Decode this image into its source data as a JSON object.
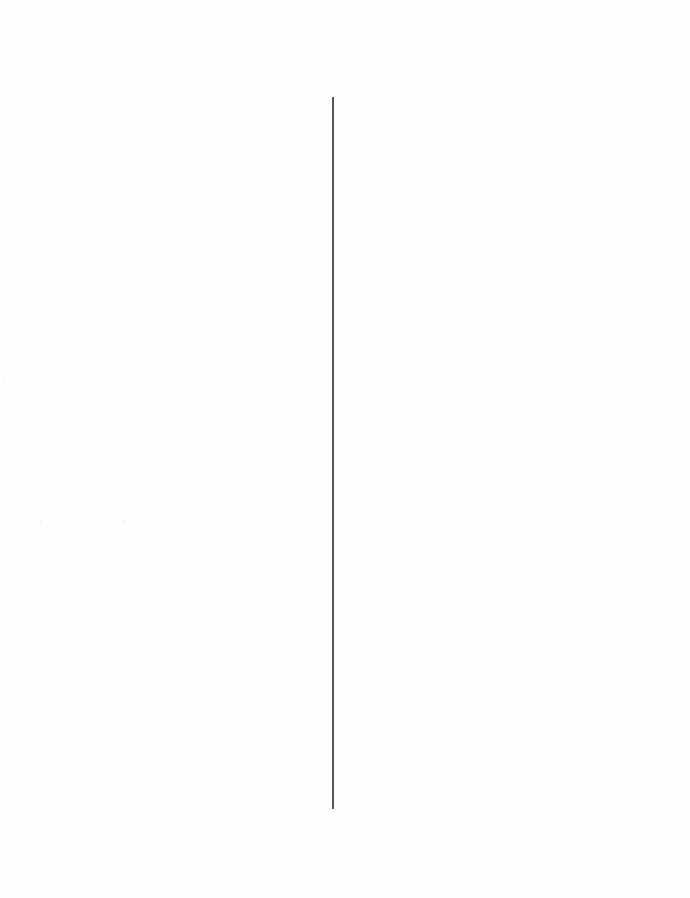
{
  "page": {
    "type": "scanned-blank-page",
    "background_color": "#fefefe"
  },
  "elements": {
    "vertical_rule": {
      "color": "#555555",
      "x": 332,
      "y_start": 97,
      "y_end": 809
    }
  }
}
